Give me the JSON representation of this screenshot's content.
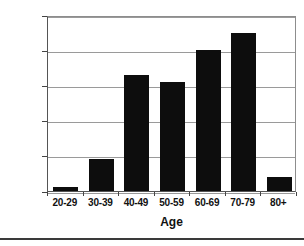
{
  "chart_data": {
    "type": "bar",
    "title": "",
    "subtitle": "",
    "xlabel": "Age",
    "ylabel": "",
    "categories": [
      "20-29",
      "30-39",
      "40-49",
      "50-59",
      "60-69",
      "70-79",
      "80+"
    ],
    "values": [
      1000,
      9000,
      33000,
      31000,
      40000,
      45000,
      4000
    ],
    "series": [
      {
        "name": "Count",
        "values": [
          1000,
          9000,
          33000,
          31000,
          40000,
          45000,
          4000
        ]
      }
    ],
    "ylim": [
      0,
      50000
    ],
    "y_ticks": [
      0,
      10000,
      20000,
      30000,
      40000,
      50000
    ],
    "y_tick_labels": [
      "0",
      "10,000",
      "20,000",
      "30,000",
      "40,000",
      "50,000"
    ],
    "grid": true,
    "grid_axis": "y",
    "legend": false,
    "legend_position": "none",
    "bar_color": "#0d0d0d",
    "grid_color": "#9a9a9a",
    "axis_color": "#555555",
    "background_color": "#ffffff"
  },
  "axes": {
    "x_title": "Age"
  }
}
